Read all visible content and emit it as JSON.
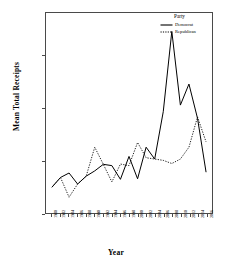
{
  "chart_data": {
    "type": "line",
    "title": "",
    "xlabel": "Year",
    "ylabel": "Mean Total Receipts",
    "x": [
      1980,
      1982,
      1984,
      1986,
      1988,
      1990,
      1992,
      1994,
      1996,
      1998,
      2000,
      2002,
      2004,
      2006,
      2008,
      2010,
      2012,
      2014,
      2016
    ],
    "categories": [
      "1980",
      "1982",
      "1984",
      "1986",
      "1988",
      "1990",
      "1992",
      "1994",
      "1996",
      "1998",
      "2000",
      "2002",
      "2004",
      "2006",
      "2008",
      "2010",
      "2012",
      "2014",
      "2016"
    ],
    "series": [
      {
        "name": "Democrat",
        "style": "solid",
        "color": "#000000",
        "values": [
          98000,
          135000,
          152000,
          110000,
          140000,
          160000,
          185000,
          180000,
          128000,
          215000,
          130000,
          250000,
          205000,
          385000,
          690000,
          410000,
          490000,
          360000,
          155000
        ]
      },
      {
        "name": "Republican",
        "style": "dotted",
        "color": "#000000",
        "values": [
          98000,
          135000,
          60000,
          110000,
          140000,
          250000,
          185000,
          118000,
          186000,
          180000,
          268000,
          210000,
          205000,
          200000,
          188000,
          205000,
          250000,
          365000,
          270000
        ]
      }
    ],
    "ylim": [
      0,
      760000
    ],
    "xlim": [
      1980,
      2016
    ],
    "yticks": [
      0,
      200000,
      400000,
      600000
    ],
    "ytick_labels": [
      "0",
      "200,000",
      "400,000",
      "600,000"
    ],
    "grid": false,
    "legend_position": "top-right"
  },
  "legend": {
    "title": "Party",
    "entries": [
      {
        "label": "Democrat",
        "style": "solid"
      },
      {
        "label": "Republican",
        "style": "dotted"
      }
    ]
  },
  "axes": {
    "x_title": "Year",
    "y_title": "Mean Total Receipts"
  }
}
